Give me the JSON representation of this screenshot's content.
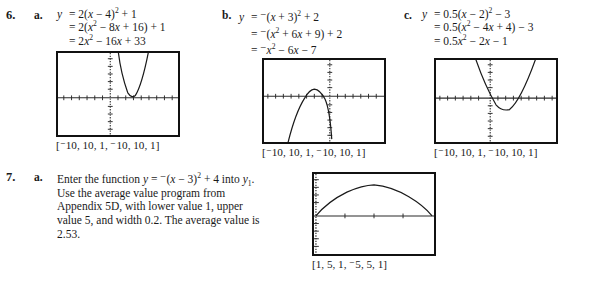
{
  "problems": [
    {
      "number": "6.",
      "parts": [
        {
          "letter": "a.",
          "equation_lines": [
            "y = 2(x − 4)² + 1",
            "= 2(x² − 8x + 16) + 1",
            "= 2x² − 16x + 33"
          ],
          "window_label": "[⁻10, 10, 1, ⁻10, 10, 1]",
          "graph": {
            "type": "parabola",
            "description": "narrow upward parabola, vertex right of y-axis just above x-axis"
          }
        },
        {
          "letter": "b.",
          "equation_lines": [
            "y = ⁻(x + 3)² + 2",
            "= ⁻(x² + 6x + 9) + 2",
            "= ⁻x² − 6x − 7"
          ],
          "window_label": "[⁻10, 10, 1, ⁻10, 10, 1]",
          "graph": {
            "type": "parabola",
            "description": "downward parabola, vertex left of y-axis slightly above x-axis"
          }
        },
        {
          "letter": "c.",
          "equation_lines": [
            "y = 0.5(x − 2)² − 3",
            "= 0.5(x² − 4x + 4) − 3",
            "= 0.5x² − 2x − 1"
          ],
          "window_label": "[⁻10, 10, 1, ⁻10, 10, 1]",
          "graph": {
            "type": "parabola",
            "description": "wide upward parabola, vertex below x-axis right of y-axis"
          }
        }
      ]
    },
    {
      "number": "7.",
      "parts": [
        {
          "letter": "a.",
          "text": "Enter the function y = ⁻(x − 3)² + 4 into y₁. Use the average value program from Appendix 5D, with lower value 1, upper value 5, and width 0.2. The average value is 2.53.",
          "window_label": "[1, 5, 1, ⁻5, 5, 1]",
          "graph": {
            "type": "parabola",
            "description": "broad downward arc peaking near center, endpoints on x-axis at edges"
          }
        }
      ]
    }
  ],
  "colors": {
    "ink": "#1a1a1a",
    "frame": "#111111",
    "axis": "#2b2b2b",
    "curve": "#1a1a1a",
    "background": "#ffffff"
  }
}
